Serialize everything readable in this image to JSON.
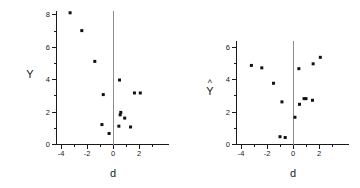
{
  "figure": {
    "background_color": "#ffffff",
    "point_color": "#111111",
    "axis_color": "#1a1a1a",
    "zero_line_color": "#8c8c8c"
  },
  "chart_data": [
    {
      "type": "scatter",
      "title": "",
      "xlabel": "d",
      "ylabel": "Y",
      "xlim": [
        -4.4,
        3.2
      ],
      "ylim": [
        0,
        8.7
      ],
      "xticks": [
        -4,
        -2,
        0,
        2
      ],
      "xticklabels": [
        "-4",
        "-2",
        "0",
        "2"
      ],
      "yticks": [
        0,
        2,
        4,
        6,
        8
      ],
      "yticklabels": [
        "0",
        "2",
        "4",
        "6",
        "8"
      ],
      "minor_xticks": [
        -3,
        -1,
        1,
        3
      ],
      "minor_yticks": [
        1,
        3,
        5,
        7
      ],
      "grid": false,
      "legend": "none",
      "annotations": [
        "vertical reference line at d = 0"
      ],
      "x": [
        -3.3,
        -2.4,
        -1.4,
        -0.85,
        -0.75,
        -0.3,
        0.45,
        0.5,
        0.55,
        0.6,
        0.9,
        1.35,
        1.65,
        2.1
      ],
      "y": [
        8.1,
        7.0,
        5.1,
        1.2,
        3.05,
        0.65,
        1.1,
        3.95,
        1.8,
        1.95,
        1.6,
        1.05,
        3.15,
        3.15
      ]
    },
    {
      "type": "scatter",
      "title": "",
      "xlabel": "d",
      "ylabel": "Ŷ",
      "ylabel_base": "Y",
      "ylabel_accent": "^",
      "xlim": [
        -4.4,
        3.2
      ],
      "ylim": [
        0,
        6.5
      ],
      "xticks": [
        -4,
        -2,
        0,
        2
      ],
      "xticklabels": [
        "-4",
        "-2",
        "0",
        "2"
      ],
      "yticks": [
        0,
        2,
        4,
        6
      ],
      "yticklabels": [
        "0",
        "2",
        "4",
        "6"
      ],
      "minor_xticks": [
        -3,
        -1,
        1,
        3
      ],
      "minor_yticks": [
        1,
        3,
        5
      ],
      "grid": false,
      "legend": "none",
      "annotations": [
        "vertical reference line at d = 0"
      ],
      "x": [
        -3.2,
        -2.4,
        -1.5,
        -1.0,
        -0.85,
        -0.6,
        0.15,
        0.45,
        0.5,
        0.85,
        1.0,
        1.5,
        1.55,
        2.1
      ],
      "y": [
        4.85,
        4.7,
        3.75,
        0.45,
        2.6,
        0.4,
        1.65,
        4.65,
        2.45,
        2.8,
        2.8,
        2.7,
        4.95,
        5.35
      ]
    }
  ]
}
